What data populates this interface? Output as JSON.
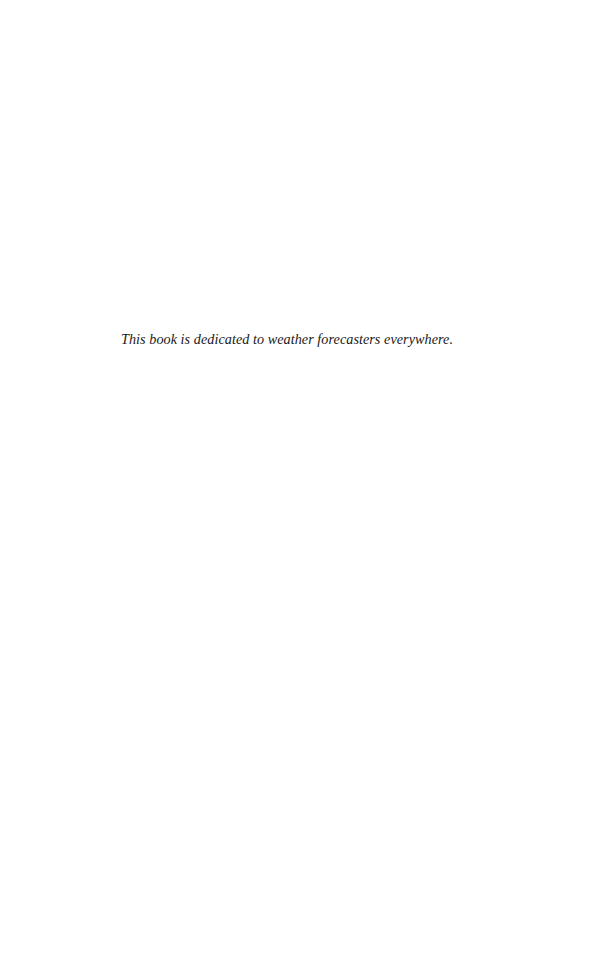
{
  "page": {
    "dedication": "This book is dedicated to weather forecasters everywhere."
  }
}
